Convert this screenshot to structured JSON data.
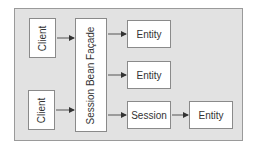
{
  "diagram": {
    "clients": [
      {
        "label": "Client"
      },
      {
        "label": "Client"
      }
    ],
    "facade": {
      "label": "Session Bean Façade"
    },
    "entities": [
      {
        "label": "Entity"
      },
      {
        "label": "Entity"
      }
    ],
    "session": {
      "label": "Session"
    },
    "session_entity": {
      "label": "Entity"
    },
    "colors": {
      "background": "#e2e2e2",
      "box": "#ffffff",
      "border": "#8a8a8a",
      "arrow": "#333333"
    }
  }
}
